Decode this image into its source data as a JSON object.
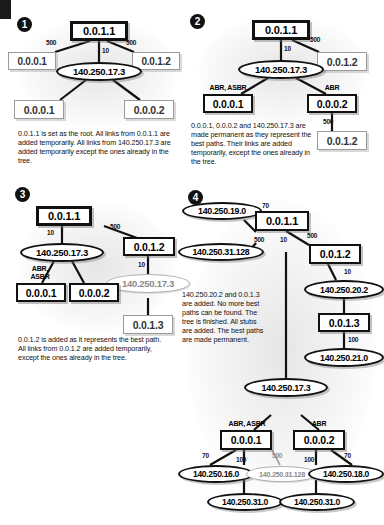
{
  "figure": {
    "panels": [
      {
        "number": "1",
        "caption": "0.0.1.1 is set as the root. All links from 0.0.1.1 are added temporarily. All links from 140.250.17.3 are added temporarily except the ones already in the tree.",
        "nodes": [
          {
            "id": "p1-root",
            "label": "0.0.1.1",
            "shape": "rect",
            "state": "root"
          },
          {
            "id": "p1-a",
            "label": "0.0.0.1",
            "shape": "rect",
            "state": "temp"
          },
          {
            "id": "p1-b",
            "label": "0.0.1.2",
            "shape": "rect",
            "state": "temp"
          },
          {
            "id": "p1-net",
            "label": "140.250.17.3",
            "shape": "ellipse",
            "state": "temp"
          },
          {
            "id": "p1-c",
            "label": "0.0.0.1",
            "shape": "rect",
            "state": "temp"
          },
          {
            "id": "p1-d",
            "label": "0.0.0.2",
            "shape": "rect",
            "state": "temp"
          }
        ],
        "costs": [
          "500",
          "10",
          "500"
        ],
        "tags": []
      },
      {
        "number": "2",
        "caption": "0.0.0.1, 0.0.0.2 and 140.250.17.3 are made permanent as they represent the best paths. Their links are added temporarily, except the ones already in the tree.",
        "nodes": [
          {
            "id": "p2-root",
            "label": "0.0.1.1",
            "shape": "rect",
            "state": "root"
          },
          {
            "id": "p2-b",
            "label": "0.0.1.2",
            "shape": "rect",
            "state": "temp"
          },
          {
            "id": "p2-net",
            "label": "140.250.17.3",
            "shape": "ellipse",
            "state": "permanent"
          },
          {
            "id": "p2-c",
            "label": "0.0.0.1",
            "shape": "rect",
            "state": "permanent"
          },
          {
            "id": "p2-d",
            "label": "0.0.0.2",
            "shape": "rect",
            "state": "permanent"
          },
          {
            "id": "p2-e",
            "label": "0.0.1.2",
            "shape": "rect",
            "state": "temp"
          }
        ],
        "costs": [
          "500",
          "10",
          "500"
        ],
        "tags": [
          "ABR, ASBR",
          "ABR"
        ]
      },
      {
        "number": "3",
        "caption": "0.0.1.2 is added as it represents the best path. All links from 0.0.1.2 are added temporarily, except the ones already in the tree.",
        "nodes": [
          {
            "id": "p3-root",
            "label": "0.0.1.1",
            "shape": "rect",
            "state": "root"
          },
          {
            "id": "p3-b",
            "label": "0.0.1.2",
            "shape": "rect",
            "state": "permanent"
          },
          {
            "id": "p3-net",
            "label": "140.250.17.3",
            "shape": "ellipse",
            "state": "permanent"
          },
          {
            "id": "p3-net2",
            "label": "140.250.17.3",
            "shape": "ellipse",
            "state": "temp"
          },
          {
            "id": "p3-c",
            "label": "0.0.0.1",
            "shape": "rect",
            "state": "permanent"
          },
          {
            "id": "p3-d",
            "label": "0.0.0.2",
            "shape": "rect",
            "state": "permanent"
          },
          {
            "id": "p3-e",
            "label": "0.0.1.3",
            "shape": "rect",
            "state": "temp"
          }
        ],
        "costs": [
          "500",
          "10",
          "10"
        ],
        "tags": [
          "ABR,",
          "ASBR"
        ]
      },
      {
        "number": "4",
        "caption": "140.250.20.2 and 0.0.1.3 are added. No more best paths can be found. The tree is finished. All stubs are added. The best paths are made permanent.",
        "nodes": [
          {
            "id": "p4-n190",
            "label": "140.250.19.0",
            "shape": "ellipse",
            "state": "permanent"
          },
          {
            "id": "p4-root",
            "label": "0.0.1.1",
            "shape": "rect",
            "state": "permanent"
          },
          {
            "id": "p4-n31a",
            "label": "140.250.31.128",
            "shape": "ellipse",
            "state": "permanent"
          },
          {
            "id": "p4-b",
            "label": "0.0.1.2",
            "shape": "rect",
            "state": "permanent"
          },
          {
            "id": "p4-n202",
            "label": "140.250.20.2",
            "shape": "ellipse",
            "state": "permanent"
          },
          {
            "id": "p4-c13",
            "label": "0.0.1.3",
            "shape": "rect",
            "state": "permanent"
          },
          {
            "id": "p4-n210",
            "label": "140.250.21.0",
            "shape": "ellipse",
            "state": "permanent"
          },
          {
            "id": "p4-n173",
            "label": "140.250.17.3",
            "shape": "ellipse",
            "state": "permanent"
          },
          {
            "id": "p4-r001",
            "label": "0.0.0.1",
            "shape": "rect",
            "state": "permanent"
          },
          {
            "id": "p4-r002",
            "label": "0.0.0.2",
            "shape": "rect",
            "state": "permanent"
          },
          {
            "id": "p4-n160",
            "label": "140.250.16.0",
            "shape": "ellipse",
            "state": "permanent"
          },
          {
            "id": "p4-n31b",
            "label": "140.250.31.128",
            "shape": "ellipse",
            "state": "temp"
          },
          {
            "id": "p4-n180",
            "label": "140.250.18.0",
            "shape": "ellipse",
            "state": "permanent"
          },
          {
            "id": "p4-n310a",
            "label": "140.250.31.0",
            "shape": "ellipse",
            "state": "permanent"
          },
          {
            "id": "p4-n310b",
            "label": "140.250.31.0",
            "shape": "ellipse",
            "state": "permanent"
          }
        ],
        "costs": [
          "70",
          "500",
          "10",
          "500",
          "10",
          "100",
          "70",
          "100",
          "500",
          "100",
          "70"
        ],
        "tags": [
          "ABR, ASBR",
          "ABR"
        ]
      }
    ]
  }
}
